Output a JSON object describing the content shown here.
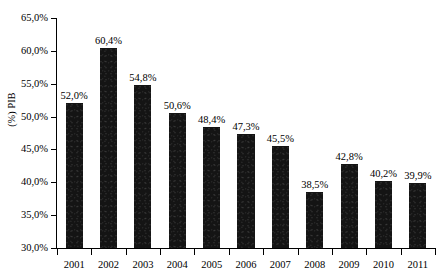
{
  "chart_data": {
    "type": "bar",
    "title": "",
    "subtitle": "",
    "xlabel": "",
    "ylabel": "(%) PIB",
    "categories": [
      "2001",
      "2002",
      "2003",
      "2004",
      "2005",
      "2006",
      "2007",
      "2008",
      "2009",
      "2010",
      "2011"
    ],
    "values": [
      52.0,
      60.4,
      54.8,
      50.6,
      48.4,
      47.3,
      45.5,
      38.5,
      42.8,
      40.2,
      39.9
    ],
    "data_labels": [
      "52,0%",
      "60,4%",
      "54,8%",
      "50,6%",
      "48,4%",
      "47,3%",
      "45,5%",
      "38,5%",
      "42,8%",
      "40,2%",
      "39,9%"
    ],
    "ylim": [
      30.0,
      65.0
    ],
    "ytick_values": [
      30.0,
      35.0,
      40.0,
      45.0,
      50.0,
      55.0,
      60.0,
      65.0
    ],
    "ytick_labels": [
      "30,0%",
      "35,0%",
      "40,0%",
      "45,0%",
      "50,0%",
      "55,0%",
      "60,0%",
      "65,0%"
    ],
    "grid": false,
    "legend": false,
    "legend_position": "none",
    "bar_color": "#141414",
    "axis_color": "#000000",
    "background_color": "#ffffff",
    "value_suffix": "%",
    "decimal_separator": ","
  }
}
